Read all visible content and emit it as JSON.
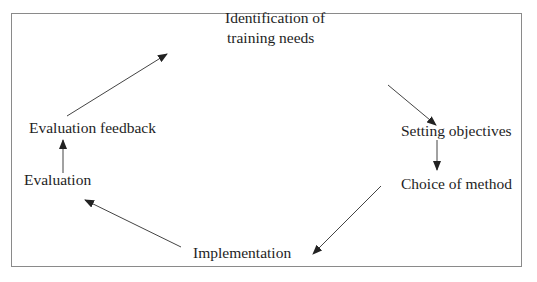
{
  "diagram": {
    "type": "cycle",
    "nodes": [
      {
        "id": "identification",
        "line1": "Identification of",
        "line2": "training needs"
      },
      {
        "id": "objectives",
        "label": "Setting objectives"
      },
      {
        "id": "method",
        "label": "Choice of method"
      },
      {
        "id": "implementation",
        "label": "Implementation"
      },
      {
        "id": "evaluation",
        "label": "Evaluation"
      },
      {
        "id": "feedback",
        "label": "Evaluation feedback"
      }
    ],
    "edges": [
      {
        "from": "identification",
        "to": "objectives"
      },
      {
        "from": "objectives",
        "to": "method"
      },
      {
        "from": "method",
        "to": "implementation"
      },
      {
        "from": "implementation",
        "to": "evaluation"
      },
      {
        "from": "evaluation",
        "to": "feedback"
      },
      {
        "from": "feedback",
        "to": "identification"
      }
    ],
    "colors": {
      "border": "#8a8a8a",
      "arrow": "#333333",
      "text": "#1e1e1e"
    }
  }
}
